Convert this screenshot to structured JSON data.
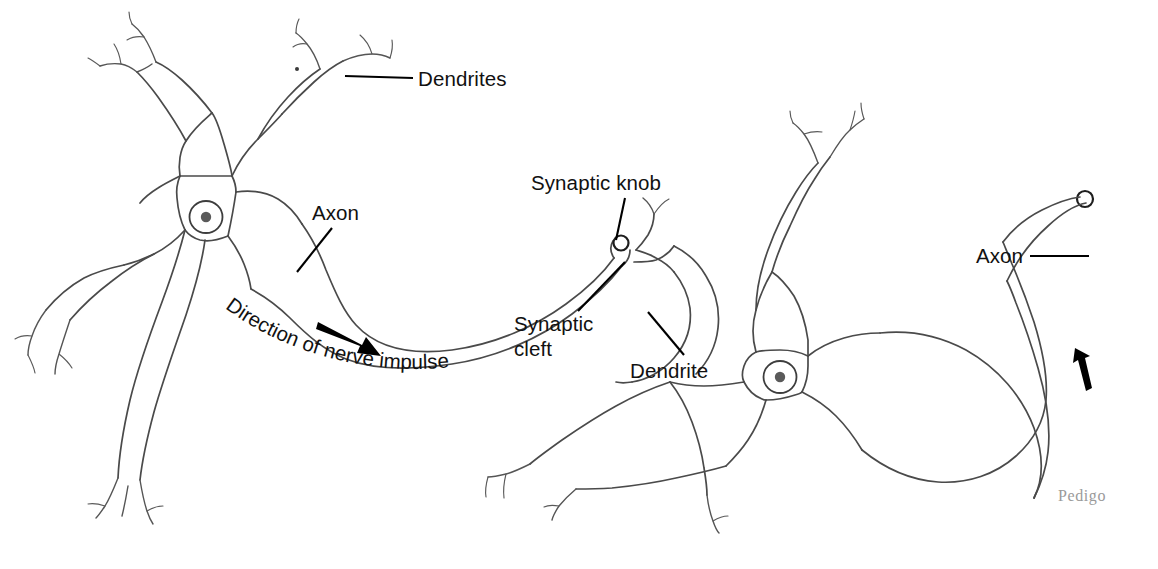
{
  "figure": {
    "background_color": "#ffffff",
    "line_color": "#4a4a4a",
    "label_color": "#111111",
    "signature_color": "#9a9a9a",
    "width": 1158,
    "height": 569
  },
  "labels": {
    "dendrites_plural": "Dendrites",
    "axon_left": "Axon",
    "direction": "Direction of nerve impulse",
    "synaptic_knob": "Synaptic knob",
    "synaptic_cleft_line1": "Synaptic",
    "synaptic_cleft_line2": "cleft",
    "dendrite_singular": "Dendrite",
    "axon_right": "Axon"
  },
  "signature": {
    "text": "Pedigo"
  },
  "structures": {
    "left_neuron": {
      "name": "presynaptic neuron",
      "parts": [
        "soma",
        "nucleus",
        "nucleolus",
        "dendrites",
        "axon",
        "synaptic knob"
      ]
    },
    "right_neuron": {
      "name": "postsynaptic neuron",
      "parts": [
        "soma",
        "nucleus",
        "nucleolus",
        "dendrites",
        "axon",
        "terminal knob"
      ]
    },
    "synapse": {
      "name": "synapse",
      "parts": [
        "synaptic knob",
        "synaptic cleft",
        "dendrite"
      ]
    }
  }
}
